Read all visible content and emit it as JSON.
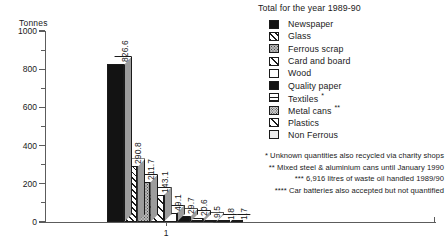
{
  "chart_data": {
    "type": "bar",
    "title": "Total for the year 1989-90",
    "xlabel": "",
    "ylabel": "Tonnes",
    "ylim": [
      0,
      1000
    ],
    "yticks": [
      0,
      200,
      400,
      600,
      800,
      1000
    ],
    "xticks": [
      "1"
    ],
    "grid": false,
    "legend_position": "top-right",
    "categories": [
      "Newspaper",
      "Glass",
      "Ferrous scrap",
      "Card and board",
      "Wood",
      "Quality paper",
      "Textiles",
      "Metal cans",
      "Plastics",
      "Non Ferrous"
    ],
    "values": [
      826.6,
      290.8,
      211.7,
      143.1,
      49.1,
      29.7,
      20.6,
      9.5,
      1.8,
      1.7
    ],
    "value_labels": [
      "826.6",
      "290.8",
      "211.7",
      "143.1",
      "49.1",
      "29.7",
      "20.6",
      "9.5",
      "1.8",
      "1.7"
    ],
    "annotations": [
      "* Unknown quantities also recycled via charity shops",
      "** Mixed steel & aluminium cans until January 1990",
      "*** 6,916 litres of waste oil handled 1989/90",
      "**** Car batteries also accepted but not quantified"
    ]
  },
  "axis": {
    "y_title": "Tonnes",
    "y_labels": [
      "1000",
      "800",
      "600",
      "400",
      "200",
      "0"
    ],
    "x_label_1": "1"
  },
  "legend": {
    "title": "Total for the year 1989-90",
    "items": [
      {
        "label": "Newspaper",
        "marker": "",
        "pattern": "pat-solid-black"
      },
      {
        "label": "Glass",
        "marker": "",
        "pattern": "pat-diag"
      },
      {
        "label": "Ferrous scrap",
        "marker": "",
        "pattern": "pat-gray-stipple"
      },
      {
        "label": "Card and board",
        "marker": "",
        "pattern": "pat-diag-wide"
      },
      {
        "label": "Wood",
        "marker": "",
        "pattern": "pat-white"
      },
      {
        "label": "Quality paper",
        "marker": "",
        "pattern": "pat-solid-black"
      },
      {
        "label": "Textiles",
        "marker": "*",
        "pattern": "pat-hlines"
      },
      {
        "label": "Metal cans",
        "marker": "**",
        "pattern": "pat-dot-stipple"
      },
      {
        "label": "Plastics",
        "marker": "",
        "pattern": "pat-diag-wide"
      },
      {
        "label": "Non Ferrous",
        "marker": "",
        "pattern": "pat-light"
      }
    ]
  },
  "footnotes": [
    "* Unknown quantities also recycled via charity shops",
    "** Mixed steel & aluminium cans until January 1990",
    "*** 6,916 litres of waste oil handled 1989/90",
    "**** Car batteries also accepted but not quantified"
  ]
}
